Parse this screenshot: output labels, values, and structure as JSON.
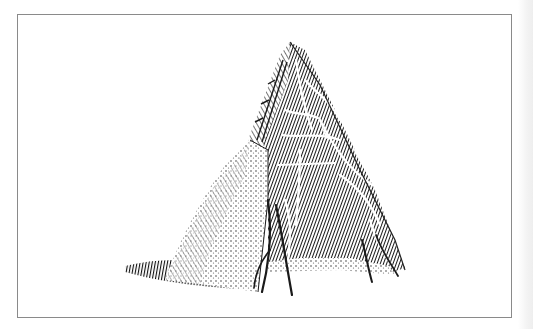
{
  "image": {
    "subject": "Engraving of a conical bark-and-branch hut (wigwam)",
    "alt": "Engraved illustration of a conical hut built from bark slabs and branches, with an open dark interior",
    "frame_color": "#8a8a8a",
    "ink_color": "#1a1a1a",
    "background": "#ffffff"
  }
}
